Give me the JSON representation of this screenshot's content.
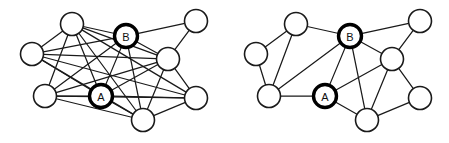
{
  "figure": {
    "background_color": "#ffffff",
    "edge_color": "#1a1a1a",
    "node_fill": "#ffffff",
    "node_stroke": "#1a1a1a",
    "highlight_stroke": "#000000",
    "node_radius": 11.5,
    "width": 449,
    "height": 143
  },
  "graphs": [
    {
      "id": "left-graph",
      "name": "dense-graph",
      "caption": "",
      "nodes": [
        {
          "id": "n0",
          "label": "",
          "x": 72,
          "y": 24,
          "highlight": false
        },
        {
          "id": "n1",
          "label": "B",
          "x": 126,
          "y": 36,
          "highlight": true
        },
        {
          "id": "n2",
          "label": "",
          "x": 196,
          "y": 21,
          "highlight": false
        },
        {
          "id": "n3",
          "label": "",
          "x": 32,
          "y": 54,
          "highlight": false
        },
        {
          "id": "n4",
          "label": "",
          "x": 168,
          "y": 59,
          "highlight": false
        },
        {
          "id": "n5",
          "label": "",
          "x": 45,
          "y": 96,
          "highlight": false
        },
        {
          "id": "n6",
          "label": "A",
          "x": 101,
          "y": 96,
          "highlight": true
        },
        {
          "id": "n7",
          "label": "",
          "x": 196,
          "y": 98,
          "highlight": false
        },
        {
          "id": "n8",
          "label": "",
          "x": 143,
          "y": 120,
          "highlight": false
        }
      ],
      "edges": [
        [
          "n0",
          "n1"
        ],
        [
          "n0",
          "n3"
        ],
        [
          "n0",
          "n4"
        ],
        [
          "n0",
          "n5"
        ],
        [
          "n0",
          "n6"
        ],
        [
          "n0",
          "n7"
        ],
        [
          "n0",
          "n8"
        ],
        [
          "n1",
          "n2"
        ],
        [
          "n1",
          "n3"
        ],
        [
          "n1",
          "n4"
        ],
        [
          "n1",
          "n5"
        ],
        [
          "n1",
          "n6"
        ],
        [
          "n1",
          "n8"
        ],
        [
          "n2",
          "n4"
        ],
        [
          "n3",
          "n4"
        ],
        [
          "n3",
          "n6"
        ],
        [
          "n3",
          "n7"
        ],
        [
          "n3",
          "n8"
        ],
        [
          "n4",
          "n5"
        ],
        [
          "n4",
          "n6"
        ],
        [
          "n4",
          "n7"
        ],
        [
          "n4",
          "n8"
        ],
        [
          "n5",
          "n6"
        ],
        [
          "n5",
          "n7"
        ],
        [
          "n5",
          "n8"
        ],
        [
          "n6",
          "n7"
        ],
        [
          "n6",
          "n8"
        ],
        [
          "n7",
          "n8"
        ]
      ]
    },
    {
      "id": "right-graph",
      "name": "sparse-graph",
      "caption": "",
      "nodes": [
        {
          "id": "m0",
          "label": "",
          "x": 296,
          "y": 24,
          "highlight": false
        },
        {
          "id": "m1",
          "label": "B",
          "x": 350,
          "y": 36,
          "highlight": true
        },
        {
          "id": "m2",
          "label": "",
          "x": 420,
          "y": 21,
          "highlight": false
        },
        {
          "id": "m3",
          "label": "",
          "x": 256,
          "y": 54,
          "highlight": false
        },
        {
          "id": "m4",
          "label": "",
          "x": 392,
          "y": 59,
          "highlight": false
        },
        {
          "id": "m5",
          "label": "",
          "x": 269,
          "y": 96,
          "highlight": false
        },
        {
          "id": "m6",
          "label": "A",
          "x": 325,
          "y": 96,
          "highlight": true
        },
        {
          "id": "m7",
          "label": "",
          "x": 420,
          "y": 98,
          "highlight": false
        },
        {
          "id": "m8",
          "label": "",
          "x": 367,
          "y": 120,
          "highlight": false
        }
      ],
      "edges": [
        [
          "m0",
          "m1"
        ],
        [
          "m0",
          "m3"
        ],
        [
          "m0",
          "m5"
        ],
        [
          "m1",
          "m2"
        ],
        [
          "m1",
          "m4"
        ],
        [
          "m1",
          "m5"
        ],
        [
          "m1",
          "m6"
        ],
        [
          "m1",
          "m8"
        ],
        [
          "m2",
          "m4"
        ],
        [
          "m3",
          "m5"
        ],
        [
          "m4",
          "m6"
        ],
        [
          "m4",
          "m7"
        ],
        [
          "m4",
          "m8"
        ],
        [
          "m5",
          "m6"
        ],
        [
          "m6",
          "m8"
        ],
        [
          "m7",
          "m8"
        ]
      ]
    }
  ]
}
